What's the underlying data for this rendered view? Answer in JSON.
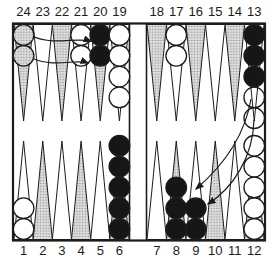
{
  "diagram": {
    "type": "backgammon-board",
    "top_numbers": [
      "24",
      "23",
      "22",
      "21",
      "20",
      "19",
      "18",
      "17",
      "16",
      "15",
      "14",
      "13"
    ],
    "bottom_numbers": [
      "1",
      "2",
      "3",
      "4",
      "5",
      "6",
      "7",
      "8",
      "9",
      "10",
      "11",
      "12"
    ],
    "shaded_points": [
      2,
      4,
      6,
      8,
      10,
      12,
      14,
      16,
      18,
      20,
      22,
      24
    ],
    "checkers": [
      {
        "point": 24,
        "color": "ghost-shaded",
        "count": 2,
        "from_index": 0
      },
      {
        "point": 21,
        "color": "white",
        "count": 2,
        "from_index": 0
      },
      {
        "point": 20,
        "color": "black",
        "count": 2,
        "from_index": 0
      },
      {
        "point": 19,
        "color": "white",
        "count": 4,
        "from_index": 0
      },
      {
        "point": 17,
        "color": "white",
        "count": 2,
        "from_index": 0
      },
      {
        "point": 13,
        "color": "black",
        "count": 3,
        "from_index": 0
      },
      {
        "point": 13,
        "color": "ghost",
        "count": 2,
        "from_index": 3
      },
      {
        "point": 12,
        "color": "white",
        "count": 5,
        "from_index": 0
      },
      {
        "point": 9,
        "color": "black",
        "count": 2,
        "from_index": 0
      },
      {
        "point": 8,
        "color": "black",
        "count": 3,
        "from_index": 0
      },
      {
        "point": 6,
        "color": "black",
        "count": 5,
        "from_index": 0
      },
      {
        "point": 1,
        "color": "white",
        "count": 2,
        "from_index": 0
      }
    ],
    "moves": [
      {
        "from": 24,
        "to": 20
      },
      {
        "from": 24,
        "to": 20
      },
      {
        "from": 13,
        "to": 9
      },
      {
        "from": 13,
        "to": 9
      }
    ],
    "colors": {
      "line": "#1c1c1c",
      "checker_black": "#161616",
      "checker_white": "#ffffff",
      "shade_dot": "#8f8f8f",
      "shade_bg": "#dedede",
      "background": "#ffffff"
    }
  }
}
